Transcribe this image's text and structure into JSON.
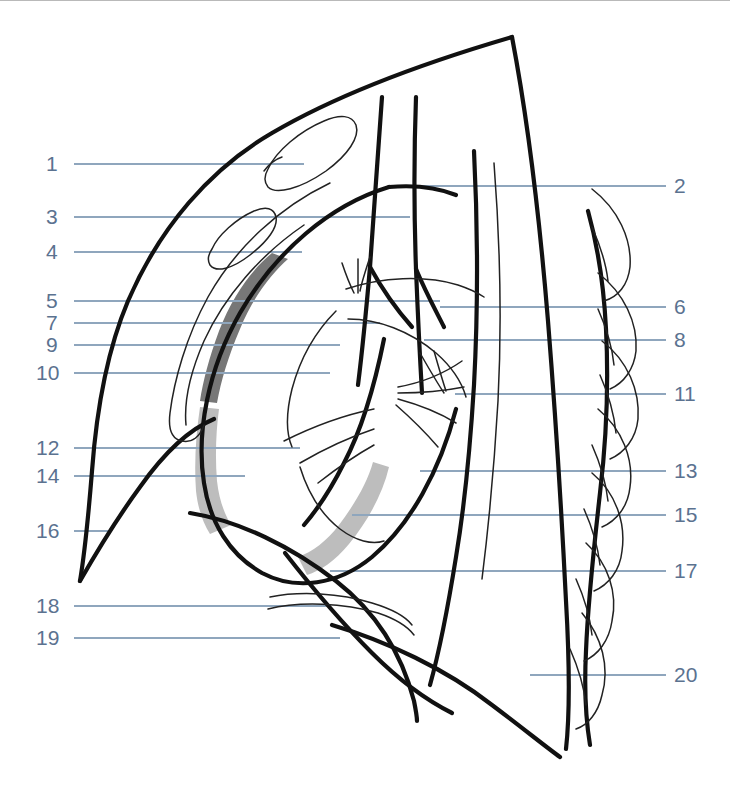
{
  "figure": {
    "background_color": "#ffffff",
    "line_color": "#000000",
    "leader_line_color": "#8fa6bd",
    "label_text_color": "#5b7290",
    "shading": {
      "dark_band_color": "#777777",
      "light_band_color": "#bdbdbd"
    }
  },
  "labels": {
    "left": [
      {
        "id": "label-1",
        "number": "1",
        "x": 46,
        "y": 152,
        "line_x1": 74,
        "line_x2": 304
      },
      {
        "id": "label-3",
        "number": "3",
        "x": 46,
        "y": 205,
        "line_x1": 74,
        "line_x2": 410
      },
      {
        "id": "label-4",
        "number": "4",
        "x": 46,
        "y": 240,
        "line_x1": 74,
        "line_x2": 302
      },
      {
        "id": "label-5",
        "number": "5",
        "x": 46,
        "y": 289,
        "line_x1": 74,
        "line_x2": 440
      },
      {
        "id": "label-7",
        "number": "7",
        "x": 46,
        "y": 311,
        "line_x1": 74,
        "line_x2": 380
      },
      {
        "id": "label-9",
        "number": "9",
        "x": 46,
        "y": 333,
        "line_x1": 74,
        "line_x2": 340
      },
      {
        "id": "label-10",
        "number": "10",
        "x": 36,
        "y": 361,
        "line_x1": 74,
        "line_x2": 330
      },
      {
        "id": "label-12",
        "number": "12",
        "x": 36,
        "y": 436,
        "line_x1": 74,
        "line_x2": 300
      },
      {
        "id": "label-14",
        "number": "14",
        "x": 36,
        "y": 464,
        "line_x1": 74,
        "line_x2": 245
      },
      {
        "id": "label-16",
        "number": "16",
        "x": 36,
        "y": 519,
        "line_x1": 74,
        "line_x2": 108
      },
      {
        "id": "label-18",
        "number": "18",
        "x": 36,
        "y": 594,
        "line_x1": 74,
        "line_x2": 330
      },
      {
        "id": "label-19",
        "number": "19",
        "x": 36,
        "y": 626,
        "line_x1": 74,
        "line_x2": 340
      }
    ],
    "right": [
      {
        "id": "label-2",
        "number": "2",
        "x": 674,
        "y": 174,
        "line_x1": 416,
        "line_x2": 666
      },
      {
        "id": "label-6",
        "number": "6",
        "x": 674,
        "y": 295,
        "line_x1": 440,
        "line_x2": 666
      },
      {
        "id": "label-8",
        "number": "8",
        "x": 674,
        "y": 328,
        "line_x1": 424,
        "line_x2": 666
      },
      {
        "id": "label-11",
        "number": "11",
        "x": 674,
        "y": 382,
        "line_x1": 455,
        "line_x2": 666
      },
      {
        "id": "label-13",
        "number": "13",
        "x": 674,
        "y": 459,
        "line_x1": 420,
        "line_x2": 666
      },
      {
        "id": "label-15",
        "number": "15",
        "x": 674,
        "y": 503,
        "line_x1": 352,
        "line_x2": 666
      },
      {
        "id": "label-17",
        "number": "17",
        "x": 674,
        "y": 559,
        "line_x1": 330,
        "line_x2": 666
      },
      {
        "id": "label-20",
        "number": "20",
        "x": 674,
        "y": 663,
        "line_x1": 530,
        "line_x2": 666
      }
    ]
  },
  "chart_data": {
    "type": "diagram",
    "annotation_numbers": [
      "1",
      "2",
      "3",
      "4",
      "5",
      "6",
      "7",
      "8",
      "9",
      "10",
      "11",
      "12",
      "13",
      "14",
      "15",
      "16",
      "17",
      "18",
      "19",
      "20"
    ],
    "left_column_numbers": [
      "1",
      "3",
      "4",
      "5",
      "7",
      "9",
      "10",
      "12",
      "14",
      "16",
      "18",
      "19"
    ],
    "right_column_numbers": [
      "2",
      "6",
      "8",
      "11",
      "13",
      "15",
      "17",
      "20"
    ]
  }
}
